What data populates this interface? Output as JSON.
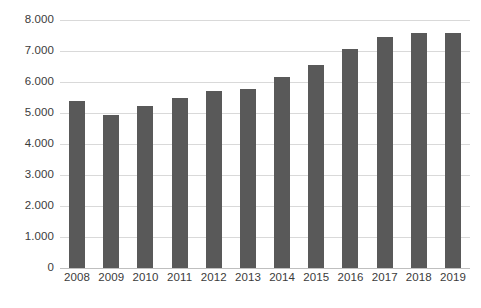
{
  "chart_data": {
    "type": "bar",
    "title": "",
    "subtitle": "",
    "xlabel": "",
    "ylabel": "",
    "categories": [
      "2008",
      "2009",
      "2010",
      "2011",
      "2012",
      "2013",
      "2014",
      "2015",
      "2016",
      "2017",
      "2018",
      "2019"
    ],
    "values": [
      5380,
      4950,
      5230,
      5480,
      5700,
      5770,
      6160,
      6560,
      7080,
      7460,
      7570,
      7570
    ],
    "value_labels": [
      "5.380",
      "4.950",
      "5.230",
      "5.480",
      "5.700",
      "5.770",
      "6.160",
      "6.560",
      "7.080",
      "7.460",
      "7.570",
      "7.570"
    ],
    "ylim": [
      0,
      8000
    ],
    "ytick_values": [
      0,
      1000,
      2000,
      3000,
      4000,
      5000,
      6000,
      7000,
      8000
    ],
    "ytick_labels": [
      "0",
      "1.000",
      "2.000",
      "3.000",
      "4.000",
      "5.000",
      "6.000",
      "7.000",
      "8.000"
    ],
    "grid": true,
    "grid_axis": "y",
    "legend": false,
    "legend_position": "none",
    "series": [
      {
        "name": "",
        "values": [
          5380,
          4950,
          5230,
          5480,
          5700,
          5770,
          6160,
          6560,
          7080,
          7460,
          7570,
          7570
        ]
      }
    ],
    "colors": {
      "bar": "#595959",
      "gridline": "#d9d9d9",
      "baseline": "#bfbfbf",
      "tick_label": "#3b3b3b",
      "background": "#ffffff"
    },
    "number_format": "dot-thousands-separator"
  }
}
